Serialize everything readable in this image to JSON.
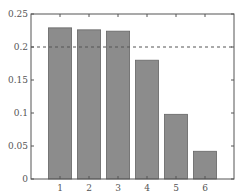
{
  "chart_data": {
    "type": "bar",
    "title": "",
    "xlabel": "",
    "ylabel": "",
    "categories": [
      "1",
      "2",
      "3",
      "4",
      "5",
      "6"
    ],
    "values": [
      0.229,
      0.226,
      0.224,
      0.18,
      0.098,
      0.042
    ],
    "ylim": [
      0,
      0.25
    ],
    "yticks": [
      "0",
      "0.05",
      "0.1",
      "0.15",
      "0.2",
      "0.25"
    ],
    "reference_line": {
      "y": 0.2,
      "style": "dashed"
    },
    "bar_color": "#8c8c8c",
    "bar_edge_color": "#666666",
    "grid": false,
    "legend": null
  }
}
